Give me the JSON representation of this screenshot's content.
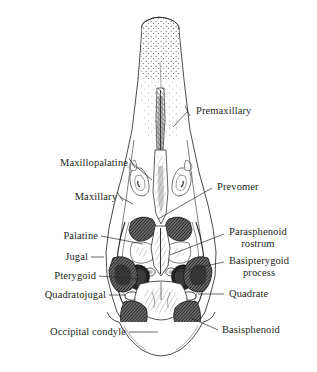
{
  "figure": {
    "style": "pen-and-ink anatomical line drawing with stipple and hatch shading",
    "background_color": "#ffffff",
    "line_color": "#231f20",
    "shading_color": "#4a4a4a"
  },
  "labels": [
    {
      "id": "premaxillary",
      "text": "Premaxillary",
      "line1": "Premaxillary",
      "line2": "",
      "side": "right",
      "x": 196,
      "y": 106,
      "leader_from_x": 188,
      "leader_from_y": 111,
      "leader_to_x": 173,
      "leader_to_y": 127
    },
    {
      "id": "maxillopalatine",
      "text": "Maxillopalatine",
      "line1": "Maxillopalatine",
      "line2": "",
      "side": "left",
      "x": 128,
      "y": 158,
      "leader_from_x": 132,
      "leader_from_y": 163,
      "leader_to_x": 152,
      "leader_to_y": 180
    },
    {
      "id": "maxillary",
      "text": "Maxillary",
      "line1": "Maxillary",
      "line2": "",
      "side": "left",
      "x": 117,
      "y": 192,
      "leader_from_x": 120,
      "leader_from_y": 197,
      "leader_to_x": 132,
      "leader_to_y": 203
    },
    {
      "id": "prevomer",
      "text": "Prevomer",
      "line1": "Prevomer",
      "line2": "",
      "side": "right",
      "x": 217,
      "y": 182,
      "leader_from_x": 212,
      "leader_from_y": 188,
      "leader_to_x": 157,
      "leader_to_y": 218
    },
    {
      "id": "palatine",
      "text": "Palatine",
      "line1": "Palatine",
      "line2": "",
      "side": "left",
      "x": 98,
      "y": 231,
      "leader_from_x": 101,
      "leader_from_y": 236,
      "leader_to_x": 143,
      "leader_to_y": 243
    },
    {
      "id": "jugal",
      "text": "Jugal",
      "line1": "Jugal",
      "line2": "",
      "side": "left",
      "x": 88,
      "y": 252,
      "leader_from_x": 91,
      "leader_from_y": 257,
      "leader_to_x": 103,
      "leader_to_y": 257
    },
    {
      "id": "pterygoid",
      "text": "Pterygoid",
      "line1": "Pterygoid",
      "line2": "",
      "side": "left",
      "x": 96,
      "y": 271,
      "leader_from_x": 99,
      "leader_from_y": 276,
      "leader_to_x": 138,
      "leader_to_y": 279
    },
    {
      "id": "quadratojugal",
      "text": "Quadratojugal",
      "line1": "Quadratojugal",
      "line2": "",
      "side": "left",
      "x": 106,
      "y": 290,
      "leader_from_x": 109,
      "leader_from_y": 295,
      "leader_to_x": 124,
      "leader_to_y": 295
    },
    {
      "id": "occipital-condyle",
      "text": "Occipital condyle",
      "line1": "Occipital condyle",
      "line2": "",
      "side": "left",
      "x": 126,
      "y": 327,
      "leader_from_x": 129,
      "leader_from_y": 332,
      "leader_to_x": 159,
      "leader_to_y": 332
    },
    {
      "id": "parasphenoid-rostrum",
      "text": "Parasphenoid rostrum",
      "line1": "Parasphenoid",
      "line2": "rostrum",
      "side": "right",
      "x": 229,
      "y": 227,
      "leader_from_x": 224,
      "leader_from_y": 234,
      "leader_to_x": 170,
      "leader_to_y": 254
    },
    {
      "id": "basipterygoid-process",
      "text": "Basipterygoid process",
      "line1": "Basipterygoid",
      "line2": "process",
      "side": "right",
      "x": 229,
      "y": 256,
      "leader_from_x": 224,
      "leader_from_y": 262,
      "leader_to_x": 177,
      "leader_to_y": 272
    },
    {
      "id": "quadrate",
      "text": "Quadrate",
      "line1": "Quadrate",
      "line2": "",
      "side": "right",
      "x": 229,
      "y": 289,
      "leader_from_x": 224,
      "leader_from_y": 294,
      "leader_to_x": 199,
      "leader_to_y": 294
    },
    {
      "id": "basisphenoid",
      "text": "Basisphenoid",
      "line1": "Basisphenoid",
      "line2": "",
      "side": "right",
      "x": 222,
      "y": 325,
      "leader_from_x": 218,
      "leader_from_y": 330,
      "leader_to_x": 190,
      "leader_to_y": 318
    }
  ],
  "anatomy_regions": [
    {
      "id": "rostrum-tip",
      "name": "beak tip (stippled)",
      "shading": "stipple"
    },
    {
      "id": "premaxillary-shaft",
      "name": "premaxillary shaft",
      "shading": "line"
    },
    {
      "id": "prevomer-blade",
      "name": "prevomer blade",
      "shading": "hatch"
    },
    {
      "id": "palatine-plate-left",
      "name": "left palatine plate",
      "shading": "dark-hatch"
    },
    {
      "id": "palatine-plate-right",
      "name": "right palatine plate",
      "shading": "dark-hatch"
    },
    {
      "id": "pterygoid-left",
      "name": "left pterygoid",
      "shading": "dark-hatch"
    },
    {
      "id": "pterygoid-right",
      "name": "right pterygoid",
      "shading": "dark-hatch"
    },
    {
      "id": "quadrate-left",
      "name": "left quadrate",
      "shading": "dark-hatch"
    },
    {
      "id": "quadrate-right",
      "name": "right quadrate",
      "shading": "dark-hatch"
    },
    {
      "id": "temporal-fossa-left",
      "name": "left temporal fossa",
      "shading": "dark-fill"
    },
    {
      "id": "temporal-fossa-right",
      "name": "right temporal fossa",
      "shading": "dark-fill"
    },
    {
      "id": "foramen-magnum",
      "name": "foramen magnum",
      "shading": "solid-black"
    },
    {
      "id": "occipital-condyle-knob",
      "name": "occipital condyle knob",
      "shading": "light"
    },
    {
      "id": "basisphenoid-plate",
      "name": "basisphenoid plate",
      "shading": "medium-hatch"
    }
  ]
}
